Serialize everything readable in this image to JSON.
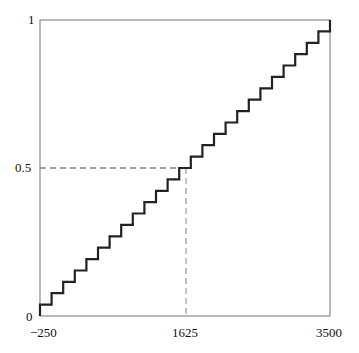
{
  "chart_data": {
    "type": "line",
    "subtype": "step",
    "title": "",
    "xlabel": "",
    "ylabel": "",
    "xlim": [
      -250,
      3500
    ],
    "ylim": [
      0,
      1
    ],
    "x_ticks": [
      "-250",
      "1625",
      "3500"
    ],
    "y_ticks": [
      "0",
      "0.5",
      "1"
    ],
    "steps": 26,
    "step_height": 0.0385,
    "series": [
      {
        "name": "CDF",
        "description": "discrete uniform step CDF with 26 equal jumps from -250 to 3500"
      }
    ],
    "annotations": [
      {
        "type": "dashed-guide",
        "x": 1625,
        "y": 0.5
      }
    ],
    "grid": false
  },
  "labels": {
    "y_top": "1",
    "y_mid": "0.5",
    "y_bottom": "0",
    "x_left": "−250",
    "x_mid": "1625",
    "x_right": "3500"
  }
}
